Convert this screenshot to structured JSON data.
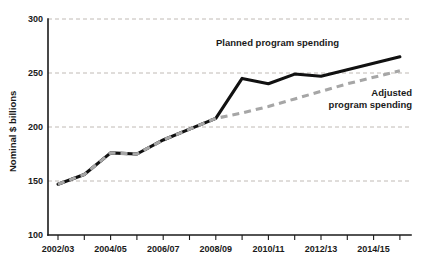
{
  "chart_data": {
    "type": "line",
    "title": "",
    "xlabel": "",
    "ylabel": "Nominal $ billions",
    "ylim": [
      100,
      300
    ],
    "yticks": [
      100,
      150,
      200,
      250,
      300
    ],
    "ytick_labels": [
      "100",
      "150",
      "200",
      "250",
      "300"
    ],
    "grid": "horizontal dashed gridlines at 150, 200, 250, 300",
    "legend": "inline series labels on plot",
    "x": [
      "2002/03",
      "2003/04",
      "2004/05",
      "2005/06",
      "2006/07",
      "2007/08",
      "2008/09",
      "2009/10",
      "2010/11",
      "2011/12",
      "2012/13",
      "2013/14",
      "2014/15",
      "2015/16"
    ],
    "xtick_labels": [
      "2002/03",
      "2004/05",
      "2006/07",
      "2008/09",
      "2010/11",
      "2012/13",
      "2014/15"
    ],
    "xtick_indices": [
      0,
      2,
      4,
      6,
      8,
      10,
      12
    ],
    "series": [
      {
        "name": "Planned program spending",
        "color": "#111111",
        "style": "solid",
        "values": [
          147,
          156,
          176,
          175,
          188,
          198,
          208,
          245,
          240,
          249,
          247,
          253,
          259,
          265
        ],
        "label_lines": [
          "Planned program spending"
        ],
        "label_x": 339,
        "label_y": 46
      },
      {
        "name": "Adjusted program spending",
        "color": "#a6a6a6",
        "style": "dashed",
        "values": [
          147,
          156,
          176,
          175,
          188,
          198,
          208,
          213,
          219,
          226,
          233,
          240,
          246,
          252
        ],
        "label_lines": [
          "Adjusted",
          "program spending"
        ],
        "label_x": 412,
        "label_y": 96
      }
    ]
  }
}
